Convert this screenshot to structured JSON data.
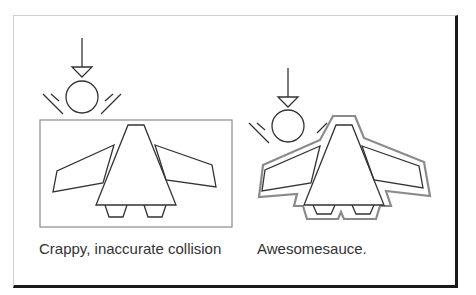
{
  "panels": [
    {
      "id": "inaccurate",
      "caption": "Crappy, inaccurate collision",
      "collision_shape": "rectangle"
    },
    {
      "id": "accurate",
      "caption": "Awesomesauce.",
      "collision_shape": "outline"
    }
  ],
  "colors": {
    "stroke": "#333333",
    "collision_stroke": "#8a8a8a",
    "frame_shadow": "#1a1a1a",
    "text": "#333333"
  },
  "icons": [
    "down-arrow-icon",
    "ball-icon",
    "impact-lines-icon",
    "spaceship-icon"
  ]
}
